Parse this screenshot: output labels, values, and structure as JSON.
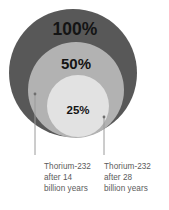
{
  "figure": {
    "type": "nested-proportional-circles",
    "background_color": "#ffffff",
    "width": 169,
    "height": 210
  },
  "circles": {
    "outer": {
      "label": "100%",
      "color": "#585858",
      "cx": 73,
      "cy": 73,
      "r": 64
    },
    "middle": {
      "label": "50%",
      "color": "#b2b2b2",
      "cx": 76,
      "cy": 90,
      "r": 48
    },
    "inner": {
      "label": "25%",
      "color": "#e2e2e2",
      "cx": 78,
      "cy": 106,
      "r": 31
    }
  },
  "leaders": {
    "left": {
      "x": 35,
      "y1": 94,
      "y2": 155,
      "color": "#9a9a9a"
    },
    "right": {
      "x": 104,
      "y1": 117,
      "y2": 155,
      "color": "#9a9a9a"
    }
  },
  "captions": {
    "left": {
      "line1": "Thorium-232",
      "line2": "after 14",
      "line3": "billion years"
    },
    "right": {
      "line1": "Thorium-232",
      "line2": "after 28",
      "line3": "billion years"
    }
  },
  "chart_data": {
    "type": "pie",
    "title": "",
    "subtitle": "",
    "xlabel": "",
    "ylabel": "",
    "categories": [
      "100%",
      "50%",
      "25%"
    ],
    "values": [
      100,
      50,
      25
    ],
    "annotations": [
      "Thorium-232 after 14 billion years",
      "Thorium-232 after 28 billion years"
    ],
    "legend_position": "none",
    "grid": false
  }
}
